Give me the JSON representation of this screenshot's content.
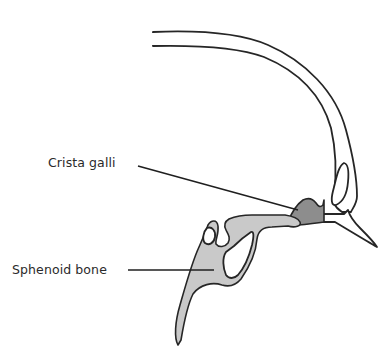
{
  "diagram": {
    "type": "anatomical-illustration",
    "colors": {
      "outline": "#262626",
      "sphenoid_fill": "#c9c9c9",
      "crista_galli_fill": "#8d8d8d",
      "background": "#ffffff"
    },
    "labels": [
      {
        "id": "crista-galli",
        "text": "Crista galli",
        "x": 48,
        "y": 155
      },
      {
        "id": "sphenoid-bone",
        "text": "Sphenoid bone",
        "x": 12,
        "y": 260
      }
    ]
  }
}
